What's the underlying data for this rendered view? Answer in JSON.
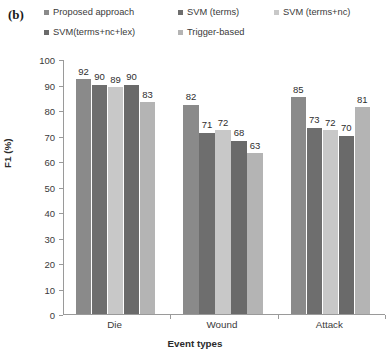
{
  "figure": {
    "panel_label": "(b)"
  },
  "legend": {
    "position": "top",
    "entries": [
      {
        "label": "Proposed approach",
        "color": "#8a8a8a"
      },
      {
        "label": "SVM (terms)",
        "color": "#6e6e6e"
      },
      {
        "label": "SVM (terms+nc)",
        "color": "#c8c8c8"
      },
      {
        "label": "SVM(terms+nc+lex)",
        "color": "#6a6a6a"
      },
      {
        "label": "Trigger-based",
        "color": "#b4b4b4"
      }
    ]
  },
  "axes": {
    "y_title": "F1 (%)",
    "x_title": "Event types",
    "y_ticks": [
      "0",
      "10",
      "20",
      "30",
      "40",
      "50",
      "60",
      "70",
      "80",
      "90",
      "100"
    ]
  },
  "chart_data": {
    "type": "bar",
    "title": "",
    "subtitle": "",
    "xlabel": "Event types",
    "ylabel": "F1 (%)",
    "ylim": [
      0,
      100
    ],
    "ytick_step": 10,
    "grid": false,
    "legend_position": "top",
    "categories": [
      "Die",
      "Wound",
      "Attack"
    ],
    "series": [
      {
        "name": "Proposed approach",
        "color": "#8a8a8a",
        "values": [
          92,
          82,
          85
        ]
      },
      {
        "name": "SVM (terms)",
        "color": "#6e6e6e",
        "values": [
          90,
          71,
          73
        ]
      },
      {
        "name": "SVM (terms+nc)",
        "color": "#c8c8c8",
        "values": [
          89,
          72,
          72
        ]
      },
      {
        "name": "SVM(terms+nc+lex)",
        "color": "#6a6a6a",
        "values": [
          90,
          68,
          70
        ]
      },
      {
        "name": "Trigger-based",
        "color": "#b4b4b4",
        "values": [
          83,
          63,
          81
        ]
      }
    ],
    "data_labels": [
      [
        "92",
        "90",
        "89",
        "90",
        "83"
      ],
      [
        "82",
        "71",
        "72",
        "68",
        "63"
      ],
      [
        "85",
        "73",
        "72",
        "70",
        "81"
      ]
    ]
  }
}
